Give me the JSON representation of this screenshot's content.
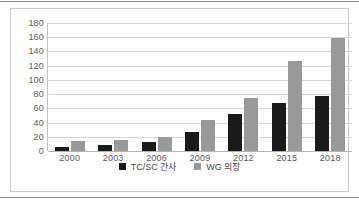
{
  "chart_data": {
    "type": "bar",
    "title": "",
    "xlabel": "",
    "ylabel": "",
    "categories": [
      "2000",
      "2003",
      "2006",
      "2009",
      "2012",
      "2015",
      "2018"
    ],
    "series": [
      {
        "name": "TC/SC 간사",
        "color": "#1a1a1a",
        "values": [
          6,
          8,
          13,
          27,
          52,
          67,
          77
        ]
      },
      {
        "name": "WG 의장",
        "color": "#999999",
        "values": [
          14,
          15,
          20,
          43,
          75,
          127,
          159
        ]
      }
    ],
    "ylim": [
      0,
      180
    ],
    "yticks": [
      "0",
      "20",
      "40",
      "60",
      "80",
      "100",
      "120",
      "140",
      "160",
      "180"
    ],
    "grid": true,
    "legend_position": "bottom"
  },
  "colors": {
    "series_0": "#1a1a1a",
    "series_1": "#999999",
    "gridline": "#d6d6d6",
    "tick_text": "#5a5a5a",
    "frame": "#c9c9c9",
    "rule": "#8a8a8a"
  }
}
